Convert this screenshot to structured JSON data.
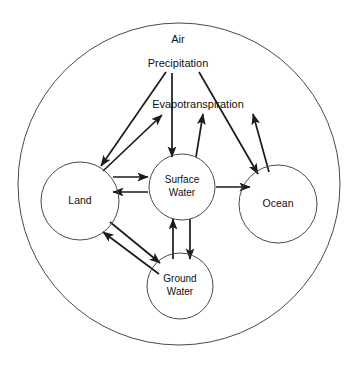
{
  "diagram": {
    "type": "node-flow-diagram",
    "colors": {
      "background": "#ffffff",
      "boundary_stroke": "#4a4a4a",
      "node_stroke": "#4a4a4a",
      "arrow_stroke": "#1b1b1b",
      "label_text": "#111111"
    },
    "boundary": {
      "name": "system-boundary",
      "shape": "circle",
      "cx": 179,
      "cy": 184,
      "r": 161
    },
    "free_labels": [
      {
        "id": "air",
        "text": "Air",
        "x": 178,
        "y": 40
      },
      {
        "id": "precipitation",
        "text": "Precipitation",
        "x": 178,
        "y": 64
      },
      {
        "id": "evapotranspiration",
        "text": "Evapotranspiration",
        "x": 198,
        "y": 105
      }
    ],
    "nodes": [
      {
        "id": "land",
        "label": "Land",
        "lines": [
          "Land"
        ],
        "cx": 80,
        "cy": 201,
        "r": 39
      },
      {
        "id": "surface-water",
        "label": "Surface Water",
        "lines": [
          "Surface",
          "Water"
        ],
        "cx": 182,
        "cy": 187,
        "r": 33
      },
      {
        "id": "ocean",
        "label": "Ocean",
        "lines": [
          "Ocean"
        ],
        "cx": 278,
        "cy": 204,
        "r": 39
      },
      {
        "id": "ground-water",
        "label": "Ground Water",
        "lines": [
          "Ground",
          "Water"
        ],
        "cx": 180,
        "cy": 286,
        "r": 33
      }
    ],
    "flows": [
      {
        "id": "precipitation-to-land",
        "from": "Precipitation",
        "to": "Land",
        "x1": 166,
        "y1": 72,
        "x2": 101,
        "y2": 166
      },
      {
        "id": "precipitation-to-surface-water",
        "from": "Precipitation",
        "to": "Surface Water",
        "x1": 172,
        "y1": 73,
        "x2": 172,
        "y2": 157
      },
      {
        "id": "precipitation-to-ocean",
        "from": "Precipitation",
        "to": "Ocean",
        "x1": 199,
        "y1": 72,
        "x2": 258,
        "y2": 174
      },
      {
        "id": "land-to-evapotranspiration",
        "from": "Land",
        "to": "Evapotranspiration",
        "x1": 103,
        "y1": 171,
        "x2": 162,
        "y2": 115
      },
      {
        "id": "surface-water-to-evapotranspiration",
        "from": "Surface Water",
        "to": "Evapotranspiration",
        "x1": 196,
        "y1": 157,
        "x2": 203,
        "y2": 114
      },
      {
        "id": "ocean-to-evapotranspiration",
        "from": "Ocean",
        "to": "Evapotranspiration",
        "x1": 269,
        "y1": 172,
        "x2": 253,
        "y2": 114
      },
      {
        "id": "land-to-surface-water",
        "from": "Land",
        "to": "Surface Water",
        "x1": 113,
        "y1": 177,
        "x2": 148,
        "y2": 177
      },
      {
        "id": "surface-water-to-land",
        "from": "Surface Water",
        "to": "Land",
        "x1": 148,
        "y1": 192,
        "x2": 113,
        "y2": 192
      },
      {
        "id": "surface-water-to-ocean",
        "from": "Surface Water",
        "to": "Ocean",
        "x1": 216,
        "y1": 187,
        "x2": 250,
        "y2": 187
      },
      {
        "id": "land-to-ground-water",
        "from": "Land",
        "to": "Ground Water",
        "x1": 110,
        "y1": 222,
        "x2": 160,
        "y2": 263
      },
      {
        "id": "ground-water-to-land",
        "from": "Ground Water",
        "to": "Land",
        "x1": 159,
        "y1": 274,
        "x2": 103,
        "y2": 232
      },
      {
        "id": "surface-water-to-ground-water",
        "from": "Surface Water",
        "to": "Ground Water",
        "x1": 190,
        "y1": 219,
        "x2": 190,
        "y2": 259
      },
      {
        "id": "ground-water-to-surface-water",
        "from": "Ground Water",
        "to": "Surface Water",
        "x1": 173,
        "y1": 259,
        "x2": 173,
        "y2": 219
      }
    ]
  }
}
